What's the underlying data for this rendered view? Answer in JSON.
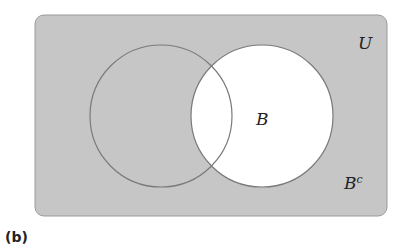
{
  "figure": {
    "caption": "(b)",
    "universe_label": "U",
    "set_label": "B",
    "complement_label_base": "B",
    "complement_label_sup": "c",
    "shaded_region": "complement of B",
    "colors": {
      "shaded_fill": "#c6c6c6",
      "unshaded_fill": "#ffffff",
      "outline": "#7a7a7a",
      "text": "#222222"
    }
  }
}
